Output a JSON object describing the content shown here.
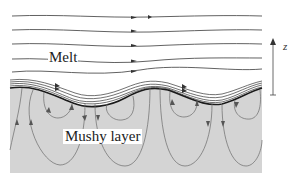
{
  "figure": {
    "labels": {
      "melt": "Melt",
      "mushy_layer": "Mushy layer",
      "axis": "z"
    },
    "colors": {
      "background": "#ffffff",
      "mushy_fill": "#d4d4d4",
      "melt_streamlines": "#3a3a3a",
      "mush_streamlines": "#6a6a6a",
      "interface": "#1a1a1a"
    },
    "regions": [
      "melt",
      "mushy layer"
    ],
    "annotations": [
      "vertical z-axis arrow pointing upward at right edge"
    ]
  }
}
